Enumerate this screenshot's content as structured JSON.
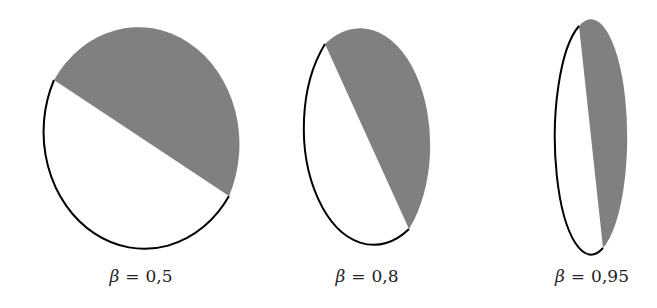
{
  "diagram": {
    "shade_color": "#808080",
    "outline_color": "#000000",
    "figures": [
      {
        "symbol": "β",
        "equals": "=",
        "value": "0,5",
        "ellipse": {
          "cx": 141,
          "cy": 138,
          "rx": 101,
          "ry": 117
        },
        "chord": {
          "x1": 54,
          "y1": 80,
          "x2": 229,
          "y2": 196
        }
      },
      {
        "symbol": "β",
        "equals": "=",
        "value": "0,8",
        "ellipse": {
          "cx": 367,
          "cy": 138,
          "rx": 70,
          "ry": 117
        },
        "chord": {
          "x1": 325,
          "y1": 44,
          "x2": 409,
          "y2": 229
        }
      },
      {
        "symbol": "β",
        "equals": "=",
        "value": "0,95",
        "ellipse": {
          "cx": 590,
          "cy": 138,
          "rx": 36,
          "ry": 117
        },
        "chord": {
          "x1": 579,
          "y1": 26,
          "x2": 603,
          "y2": 248
        }
      }
    ]
  }
}
